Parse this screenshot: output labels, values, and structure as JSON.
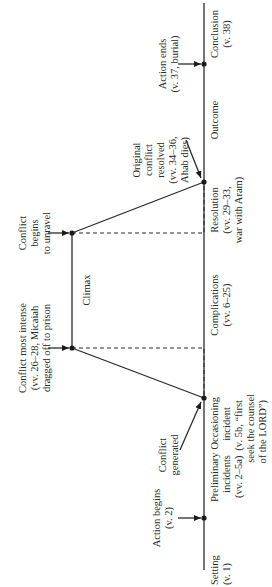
{
  "diagram": {
    "type": "plot-structure (Freytag-style) diagram, rotated 90° counter-clockwise",
    "colors": {
      "ink": "#2a2a2a",
      "background": "#ffffff"
    },
    "segments": {
      "setting": {
        "l1": "Setting",
        "l2": "(v. 1)"
      },
      "preliminary": {
        "l1": "Preliminary",
        "l2": "incidents",
        "l3": "(vv. 2–5a)"
      },
      "occasioning": {
        "l1": "Occasioning",
        "l2": "incident",
        "l3": "(v. 5b, “first",
        "l4": "seek the counsel",
        "l5": "of the LORD”)"
      },
      "complications": {
        "l1": "Complications",
        "l2": "(vv. 6–25)"
      },
      "climax": {
        "l1": "Climax"
      },
      "resolution": {
        "l1": "Resolution",
        "l2": "(vv. 29–33,",
        "l3": "war with Aram)"
      },
      "outcome": {
        "l1": "Outcome"
      },
      "conclusion": {
        "l1": "Conclusion",
        "l2": "(v. 38)"
      }
    },
    "events": {
      "action_begins": {
        "l1": "Action begins",
        "l2": "(v. 2)"
      },
      "conflict_generated": {
        "l1": "Conflict",
        "l2": "generated"
      },
      "conflict_most_intense": {
        "l1": "Conflict most intense",
        "l2": "(vv. 26–28, Micaiah",
        "l3": "dragged off to prison"
      },
      "conflict_unravel": {
        "l1": "Conflict",
        "l2": "begins",
        "l3": "to unravel"
      },
      "original_resolved": {
        "l1": "Original",
        "l2": "conflict",
        "l3": "resolved",
        "l4": "(vv. 34–36,",
        "l5": "Ahab dies)"
      },
      "action_ends": {
        "l1": "Action ends",
        "l2": "(v. 37, burial)"
      }
    }
  }
}
